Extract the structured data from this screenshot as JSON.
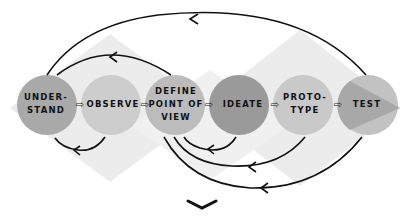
{
  "diagram": {
    "stages": [
      {
        "id": "understand",
        "lines": [
          "UNDER-",
          "STAND"
        ],
        "color": "#a9a9a9"
      },
      {
        "id": "observe",
        "lines": [
          "OBSERVE"
        ],
        "color": "#cdcdcd"
      },
      {
        "id": "define",
        "lines": [
          "DEFINE",
          "POINT OF",
          "VIEW"
        ],
        "color": "#bcbcbc"
      },
      {
        "id": "ideate",
        "lines": [
          "IDEATE"
        ],
        "color": "#9a9a9a"
      },
      {
        "id": "prototype",
        "lines": [
          "PROTO-",
          "TYPE"
        ],
        "color": "#c9c9c9"
      },
      {
        "id": "test",
        "lines": [
          "TEST"
        ],
        "color": "#b0b0b0"
      }
    ],
    "connector_glyph": "⇨",
    "background_shapes_color": "#ececec",
    "arrow_color": "#111111",
    "scroll_indicator": "chevron-down"
  }
}
